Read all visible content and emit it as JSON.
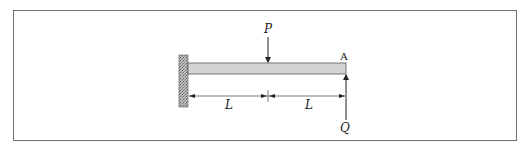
{
  "diagram": {
    "labels": {
      "load_p": "P",
      "point_a": "A",
      "force_q": "Q",
      "span_left": "L",
      "span_right": "L"
    },
    "colors": {
      "frame": "#707070",
      "beam_fill": "#d4d4d4",
      "beam_stroke": "#555555",
      "wall_fill": "#9a9a9a",
      "line": "#333333"
    },
    "elements": [
      {
        "type": "fixed-support",
        "position": "left"
      },
      {
        "type": "beam",
        "length": "2L"
      },
      {
        "type": "point-load",
        "label": "P",
        "direction": "down",
        "position": "midspan"
      },
      {
        "type": "point-force",
        "label": "Q",
        "direction": "up",
        "position": "free end A"
      },
      {
        "type": "dimension",
        "segments": [
          "L",
          "L"
        ]
      }
    ]
  }
}
